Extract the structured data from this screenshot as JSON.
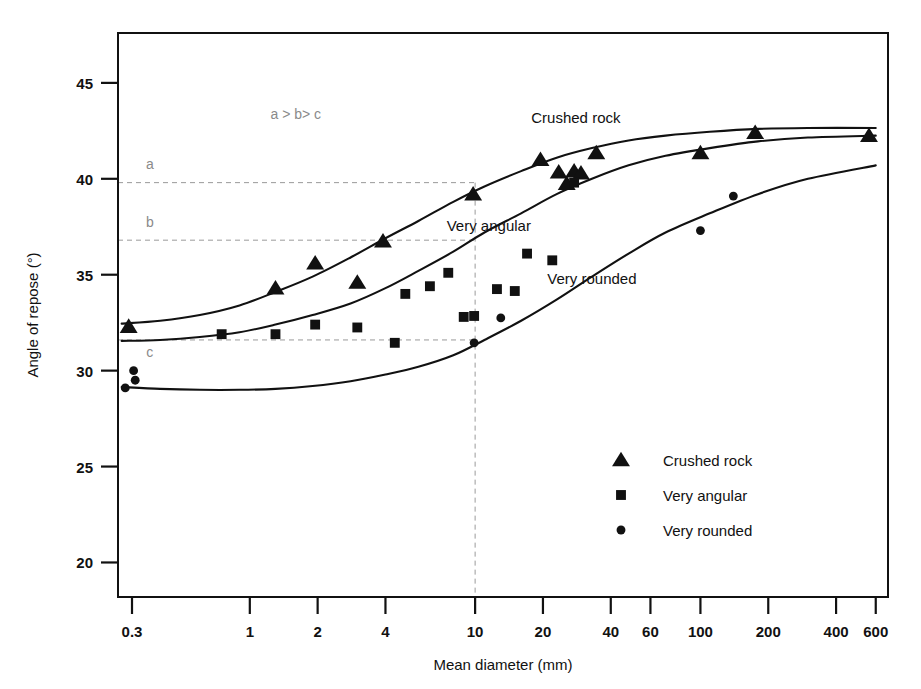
{
  "chart_data": {
    "type": "scatter",
    "title": "",
    "xlabel": "Mean diameter (mm)",
    "ylabel": "Angle of repose (°)",
    "xscale": "log",
    "yscale": "linear",
    "xlim": [
      0.26,
      680
    ],
    "ylim": [
      18.2,
      47.6
    ],
    "grid": false,
    "xticks": [
      0.3,
      1,
      2,
      4,
      10,
      20,
      40,
      60,
      100,
      200,
      400,
      600
    ],
    "xticklabels": [
      "0.3",
      "1",
      "2",
      "4",
      "10",
      "20",
      "40",
      "60",
      "100",
      "200",
      "400",
      "600"
    ],
    "yticks": [
      20,
      25,
      30,
      35,
      40,
      45
    ],
    "yticklabels": [
      "20",
      "25",
      "30",
      "35",
      "40",
      "45"
    ],
    "legend_position": "center-right",
    "series": [
      {
        "name": "Crushed rock",
        "marker": "triangle",
        "color": "#111111",
        "points": [
          [
            0.29,
            32.3
          ],
          [
            1.3,
            34.3
          ],
          [
            1.95,
            35.6
          ],
          [
            3.0,
            34.6
          ],
          [
            3.9,
            36.75
          ],
          [
            9.8,
            39.2
          ],
          [
            19.5,
            41.0
          ],
          [
            23.5,
            40.35
          ],
          [
            25.5,
            39.75
          ],
          [
            27.5,
            40.4
          ],
          [
            29.5,
            40.3
          ],
          [
            34.5,
            41.35
          ],
          [
            100,
            41.35
          ],
          [
            175,
            42.4
          ],
          [
            560,
            42.25
          ]
        ]
      },
      {
        "name": "Very angular",
        "marker": "square",
        "color": "#111111",
        "points": [
          [
            0.75,
            31.9
          ],
          [
            1.3,
            31.9
          ],
          [
            1.95,
            32.4
          ],
          [
            3.0,
            32.25
          ],
          [
            4.4,
            31.45
          ],
          [
            4.9,
            34.0
          ],
          [
            6.3,
            34.4
          ],
          [
            7.6,
            35.1
          ],
          [
            8.9,
            32.8
          ],
          [
            9.9,
            32.85
          ],
          [
            12.5,
            34.25
          ],
          [
            15.0,
            34.15
          ],
          [
            17.0,
            36.1
          ],
          [
            22.0,
            35.75
          ],
          [
            27.5,
            39.8
          ]
        ]
      },
      {
        "name": "Very rounded",
        "marker": "circle",
        "color": "#111111",
        "points": [
          [
            0.28,
            29.1
          ],
          [
            0.305,
            30.0
          ],
          [
            0.31,
            29.5
          ],
          [
            9.9,
            31.45
          ],
          [
            13.0,
            32.75
          ],
          [
            100,
            37.3
          ],
          [
            140,
            39.1
          ]
        ]
      }
    ],
    "curves": [
      {
        "name": "Crushed rock",
        "label": "Crushed rock",
        "label_at": [
          28,
          42.9
        ],
        "points": [
          [
            0.27,
            32.45
          ],
          [
            0.4,
            32.6
          ],
          [
            0.6,
            32.9
          ],
          [
            0.9,
            33.4
          ],
          [
            1.3,
            34.1
          ],
          [
            1.9,
            34.9
          ],
          [
            2.8,
            35.9
          ],
          [
            4.0,
            36.9
          ],
          [
            5.6,
            37.8
          ],
          [
            8.0,
            38.8
          ],
          [
            11.0,
            39.6
          ],
          [
            16.0,
            40.4
          ],
          [
            23.0,
            41.1
          ],
          [
            33.0,
            41.6
          ],
          [
            48.0,
            42.0
          ],
          [
            70.0,
            42.25
          ],
          [
            110.0,
            42.45
          ],
          [
            180.0,
            42.6
          ],
          [
            300.0,
            42.65
          ],
          [
            600.0,
            42.65
          ]
        ]
      },
      {
        "name": "Very angular",
        "label": "Very angular",
        "label_at": [
          11.5,
          37.3
        ],
        "points": [
          [
            0.27,
            31.55
          ],
          [
            0.4,
            31.6
          ],
          [
            0.6,
            31.75
          ],
          [
            0.9,
            32.0
          ],
          [
            1.3,
            32.4
          ],
          [
            1.9,
            32.9
          ],
          [
            2.8,
            33.5
          ],
          [
            4.0,
            34.3
          ],
          [
            5.6,
            35.2
          ],
          [
            8.0,
            36.2
          ],
          [
            11.0,
            37.2
          ],
          [
            16.0,
            38.2
          ],
          [
            23.0,
            39.2
          ],
          [
            33.0,
            40.0
          ],
          [
            48.0,
            40.7
          ],
          [
            70.0,
            41.2
          ],
          [
            110.0,
            41.6
          ],
          [
            180.0,
            41.95
          ],
          [
            300.0,
            42.15
          ],
          [
            600.0,
            42.25
          ]
        ]
      },
      {
        "name": "Very rounded",
        "label": "Very rounded",
        "label_at": [
          33,
          34.5
        ],
        "points": [
          [
            0.27,
            29.15
          ],
          [
            0.4,
            29.05
          ],
          [
            0.6,
            29.0
          ],
          [
            0.9,
            29.0
          ],
          [
            1.3,
            29.05
          ],
          [
            1.9,
            29.2
          ],
          [
            2.8,
            29.45
          ],
          [
            4.0,
            29.8
          ],
          [
            5.6,
            30.2
          ],
          [
            8.0,
            30.8
          ],
          [
            11.0,
            31.6
          ],
          [
            16.0,
            32.6
          ],
          [
            23.0,
            33.7
          ],
          [
            33.0,
            34.9
          ],
          [
            48.0,
            36.1
          ],
          [
            70.0,
            37.2
          ],
          [
            110.0,
            38.2
          ],
          [
            180.0,
            39.2
          ],
          [
            300.0,
            40.0
          ],
          [
            600.0,
            40.7
          ]
        ]
      }
    ],
    "guide_lines": [
      {
        "id": "a",
        "type": "horizontal",
        "value": 39.8,
        "label": "a",
        "label_at": [
          0.36,
          40.5
        ],
        "x_end": 10
      },
      {
        "id": "b",
        "type": "horizontal",
        "value": 36.8,
        "label": "b",
        "label_at": [
          0.36,
          37.5
        ],
        "x_end": 10
      },
      {
        "id": "c",
        "type": "horizontal",
        "value": 31.6,
        "label": "c",
        "label_at": [
          0.36,
          30.7
        ],
        "x_end": 10
      },
      {
        "id": "v10",
        "type": "vertical",
        "value": 10,
        "label": "",
        "label_at": null,
        "y_end": 39.8
      }
    ],
    "annotations": [
      {
        "text": "a > b> c",
        "at": [
          1.6,
          43.1
        ],
        "color": "#8a8a8a"
      }
    ],
    "legend": [
      {
        "label": "Crushed rock",
        "marker": "triangle"
      },
      {
        "label": "Very angular",
        "marker": "square"
      },
      {
        "label": "Very rounded",
        "marker": "circle"
      }
    ]
  },
  "colors": {
    "ink": "#111111",
    "guide": "#9a9a9a",
    "background": "#ffffff"
  }
}
